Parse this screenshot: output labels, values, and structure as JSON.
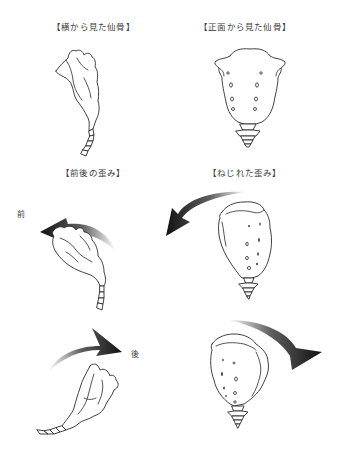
{
  "panels": [
    {
      "id": "side-view",
      "label": "【横から見た仙骨】"
    },
    {
      "id": "front-view",
      "label": "【正面から見た仙骨】"
    },
    {
      "id": "front-back-distortion",
      "label": "【前後の歪み】"
    },
    {
      "id": "twist-distortion",
      "label": "【ねじれた歪み】"
    }
  ],
  "direction_labels": {
    "front": "前",
    "back": "後"
  },
  "arrows": [
    {
      "panel": "front-back-distortion",
      "direction": "counterclockwise-left",
      "label": "前"
    },
    {
      "panel": "front-back-distortion",
      "direction": "clockwise-right",
      "label": "後"
    },
    {
      "panel": "twist-distortion",
      "direction": "counterclockwise-left"
    },
    {
      "panel": "twist-distortion",
      "direction": "clockwise-right"
    }
  ],
  "colors": {
    "arrow": "#1a1a1a",
    "outline": "#2a2a2a",
    "background": "#ffffff",
    "text": "#3a3a3a"
  }
}
